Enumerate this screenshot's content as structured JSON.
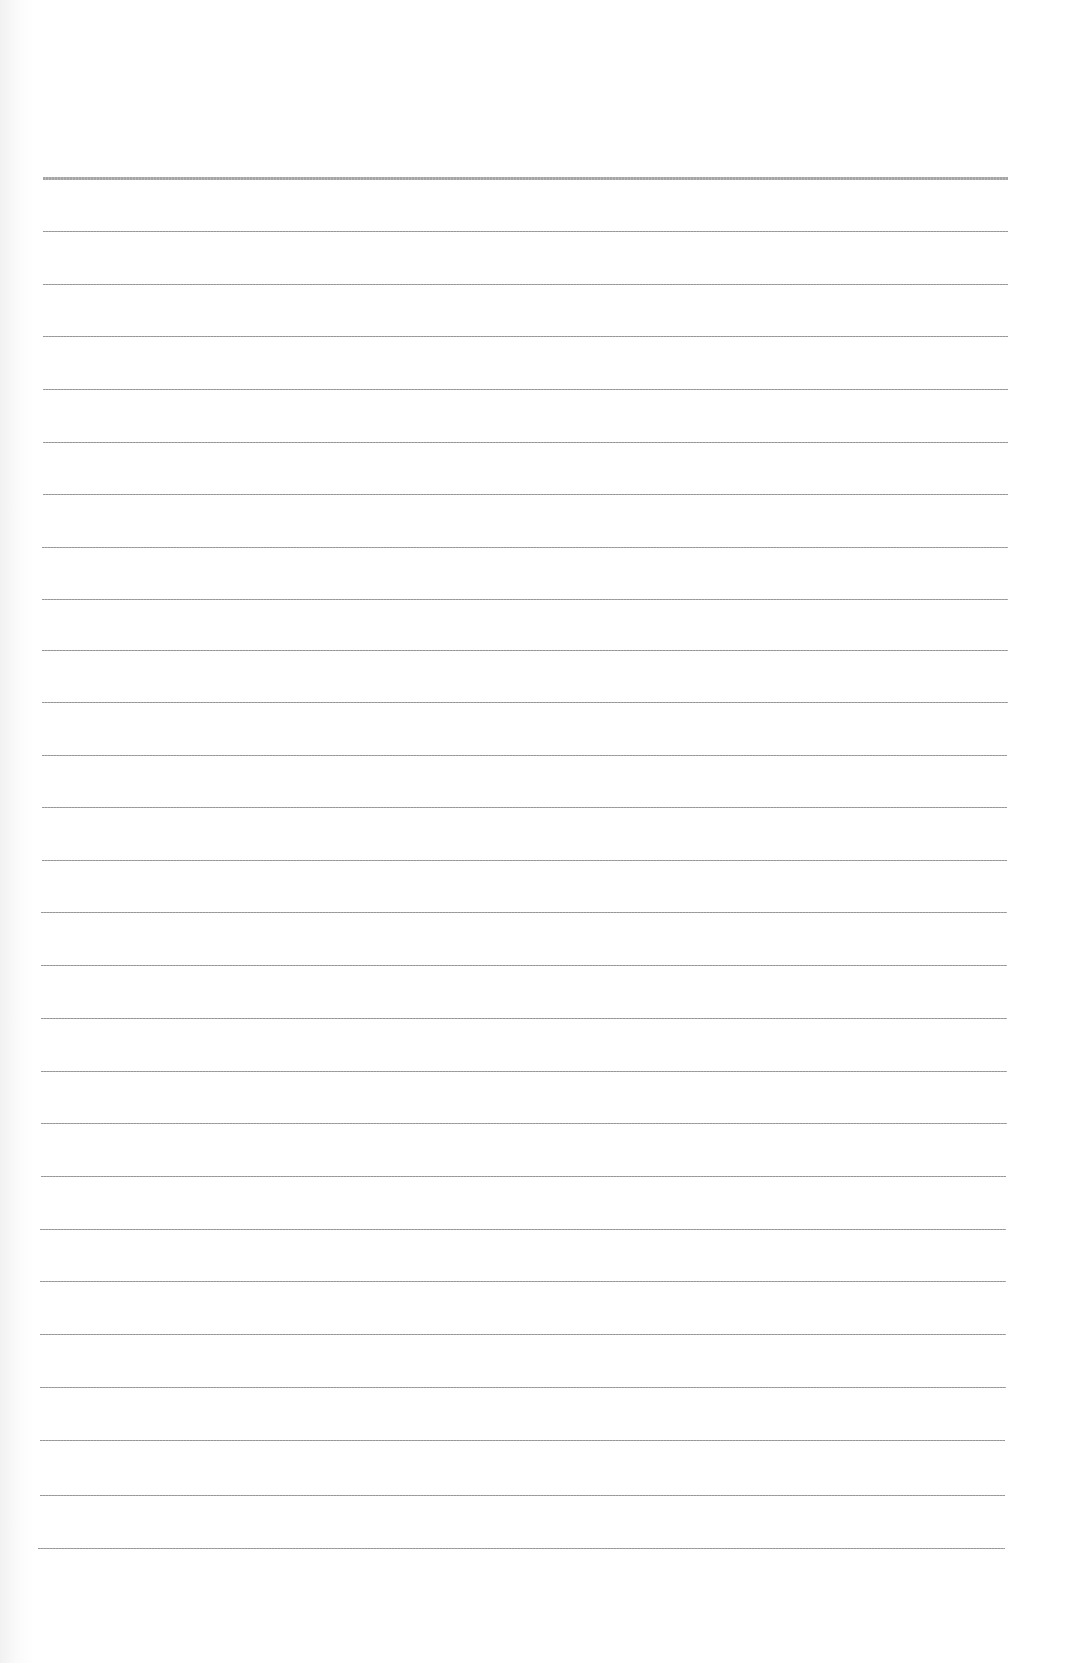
{
  "page": {
    "type": "lined-paper",
    "background": "#ffffff",
    "line_color": "#8a8a8a",
    "header_bleedthrough": [
      "",
      ""
    ],
    "rules": [
      {
        "y": 177,
        "x1": 43,
        "x2": 1008,
        "weight": "thick"
      },
      {
        "y": 231,
        "x1": 43,
        "x2": 1008,
        "weight": "thin"
      },
      {
        "y": 284,
        "x1": 43,
        "x2": 1008,
        "weight": "thin"
      },
      {
        "y": 336,
        "x1": 43,
        "x2": 1008,
        "weight": "thin"
      },
      {
        "y": 389,
        "x1": 43,
        "x2": 1008,
        "weight": "thin"
      },
      {
        "y": 442,
        "x1": 43,
        "x2": 1008,
        "weight": "thin"
      },
      {
        "y": 494,
        "x1": 43,
        "x2": 1008,
        "weight": "thin"
      },
      {
        "y": 547,
        "x1": 42,
        "x2": 1008,
        "weight": "thin"
      },
      {
        "y": 599,
        "x1": 42,
        "x2": 1008,
        "weight": "thin"
      },
      {
        "y": 650,
        "x1": 42,
        "x2": 1008,
        "weight": "thin"
      },
      {
        "y": 702,
        "x1": 42,
        "x2": 1008,
        "weight": "thin"
      },
      {
        "y": 755,
        "x1": 42,
        "x2": 1007,
        "weight": "thin"
      },
      {
        "y": 807,
        "x1": 42,
        "x2": 1007,
        "weight": "thin"
      },
      {
        "y": 860,
        "x1": 42,
        "x2": 1007,
        "weight": "thin"
      },
      {
        "y": 912,
        "x1": 41,
        "x2": 1007,
        "weight": "thin"
      },
      {
        "y": 965,
        "x1": 41,
        "x2": 1007,
        "weight": "thin"
      },
      {
        "y": 1018,
        "x1": 41,
        "x2": 1007,
        "weight": "thin"
      },
      {
        "y": 1071,
        "x1": 41,
        "x2": 1007,
        "weight": "thin"
      },
      {
        "y": 1123,
        "x1": 41,
        "x2": 1007,
        "weight": "thin"
      },
      {
        "y": 1176,
        "x1": 41,
        "x2": 1006,
        "weight": "thin"
      },
      {
        "y": 1229,
        "x1": 40,
        "x2": 1006,
        "weight": "thin"
      },
      {
        "y": 1281,
        "x1": 40,
        "x2": 1006,
        "weight": "thin"
      },
      {
        "y": 1334,
        "x1": 40,
        "x2": 1006,
        "weight": "thin"
      },
      {
        "y": 1387,
        "x1": 40,
        "x2": 1006,
        "weight": "thin"
      },
      {
        "y": 1440,
        "x1": 40,
        "x2": 1005,
        "weight": "thin"
      },
      {
        "y": 1495,
        "x1": 40,
        "x2": 1005,
        "weight": "thin"
      },
      {
        "y": 1548,
        "x1": 38,
        "x2": 1005,
        "weight": "thin"
      }
    ]
  }
}
